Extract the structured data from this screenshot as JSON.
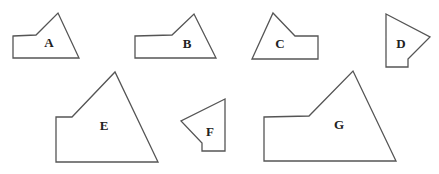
{
  "diagram": {
    "stroke_color": "#555555",
    "shapes": [
      {
        "label": "A",
        "points": "13,36 36,35 58,13 79,58 13,58",
        "label_pos": [
          49,
          42
        ]
      },
      {
        "label": "B",
        "points": "135,36 172,35 194,14 216,58 135,58",
        "label_pos": [
          187,
          43
        ]
      },
      {
        "label": "C",
        "points": "273,13 295,36 318,36 318,59 252,59",
        "label_pos": [
          280,
          43
        ]
      },
      {
        "label": "D",
        "points": "386,14 430,37 408,59 408,67 386,67",
        "label_pos": [
          401,
          43
        ]
      },
      {
        "label": "E",
        "points": "56,117 72,117 115,72 158,162 56,162",
        "label_pos": [
          104,
          125
        ]
      },
      {
        "label": "F",
        "points": "225,99 181,121 202,143 202,151 225,151",
        "label_pos": [
          210,
          131
        ]
      },
      {
        "label": "G",
        "points": "264,117 309,116 353,71 396,161 264,161",
        "label_pos": [
          339,
          124
        ]
      }
    ]
  }
}
